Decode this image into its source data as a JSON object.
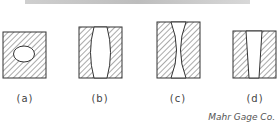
{
  "figure": {
    "panels": [
      {
        "id": "a",
        "label": "(a)",
        "shape": "square with elliptical hole"
      },
      {
        "id": "b",
        "label": "(b)",
        "shape": "block with convex (barrel) bore"
      },
      {
        "id": "c",
        "label": "(c)",
        "shape": "block with concave (hourglass) bore"
      },
      {
        "id": "d",
        "label": "(d)",
        "shape": "block with tapered bore"
      }
    ],
    "credit": "Mahr Gage Co."
  },
  "colors": {
    "stroke": "#333333",
    "hatch": "#555555",
    "background": "#ffffff",
    "topbar": "#c4c4c4"
  }
}
